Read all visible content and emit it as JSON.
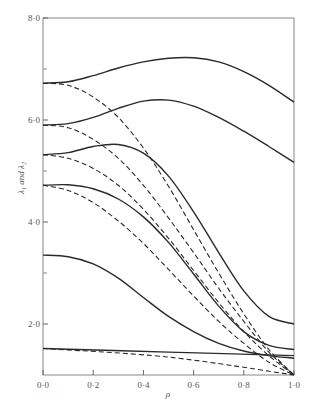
{
  "chart_data": {
    "type": "line",
    "title": "",
    "xlabel": "ρ",
    "ylabel": "λ₁ and λ₂",
    "xlim": [
      0.0,
      1.0
    ],
    "ylim": [
      1.0,
      8.0
    ],
    "grid": false,
    "legend": null,
    "x_ticks": [
      "0·0",
      "0·2",
      "0·4",
      "0·6",
      "0·8",
      "1·0"
    ],
    "x_tick_values": [
      0.0,
      0.2,
      0.4,
      0.6,
      0.8,
      1.0
    ],
    "y_ticks": [
      "2·0",
      "4·0",
      "6·0",
      "8·0"
    ],
    "y_tick_values": [
      2.0,
      4.0,
      6.0,
      8.0
    ],
    "y_minor_ticks": [
      3.0,
      5.0,
      7.0
    ],
    "series": [
      {
        "name": "solid-1",
        "style": "solid",
        "x": [
          0.0,
          0.1,
          0.2,
          0.3,
          0.4,
          0.5,
          0.6,
          0.7,
          0.8,
          0.9,
          1.0
        ],
        "values": [
          6.72,
          6.75,
          6.87,
          7.02,
          7.14,
          7.21,
          7.22,
          7.14,
          6.95,
          6.68,
          6.35
        ]
      },
      {
        "name": "dashed-1",
        "style": "dashed",
        "x": [
          0.0,
          0.1,
          0.2,
          0.3,
          0.4,
          0.5,
          0.6,
          0.7,
          0.8,
          0.9,
          1.0
        ],
        "values": [
          6.72,
          6.68,
          6.45,
          6.05,
          5.45,
          4.7,
          3.85,
          3.0,
          2.2,
          1.5,
          1.0
        ]
      },
      {
        "name": "solid-2",
        "style": "solid",
        "x": [
          0.0,
          0.1,
          0.2,
          0.3,
          0.4,
          0.5,
          0.6,
          0.7,
          0.8,
          0.9,
          1.0
        ],
        "values": [
          5.9,
          5.93,
          6.05,
          6.23,
          6.37,
          6.39,
          6.27,
          6.05,
          5.78,
          5.48,
          5.17
        ]
      },
      {
        "name": "dashed-2",
        "style": "dashed",
        "x": [
          0.0,
          0.1,
          0.2,
          0.3,
          0.4,
          0.5,
          0.6,
          0.7,
          0.8,
          0.9,
          1.0
        ],
        "values": [
          5.9,
          5.85,
          5.62,
          5.25,
          4.72,
          4.08,
          3.4,
          2.7,
          2.05,
          1.45,
          1.0
        ]
      },
      {
        "name": "solid-3",
        "style": "solid",
        "x": [
          0.0,
          0.1,
          0.2,
          0.3,
          0.4,
          0.5,
          0.6,
          0.7,
          0.8,
          0.9,
          1.0
        ],
        "values": [
          5.32,
          5.36,
          5.48,
          5.52,
          5.35,
          4.9,
          4.2,
          3.4,
          2.65,
          2.15,
          2.0
        ]
      },
      {
        "name": "dashed-3",
        "style": "dashed",
        "x": [
          0.0,
          0.1,
          0.2,
          0.3,
          0.4,
          0.5,
          0.6,
          0.7,
          0.8,
          0.9,
          1.0
        ],
        "values": [
          5.32,
          5.25,
          5.05,
          4.72,
          4.25,
          3.68,
          3.05,
          2.42,
          1.85,
          1.38,
          1.0
        ]
      },
      {
        "name": "solid-4",
        "style": "solid",
        "x": [
          0.0,
          0.1,
          0.2,
          0.3,
          0.4,
          0.5,
          0.6,
          0.7,
          0.8,
          0.9,
          1.0
        ],
        "values": [
          4.72,
          4.73,
          4.65,
          4.45,
          4.1,
          3.6,
          2.98,
          2.35,
          1.85,
          1.58,
          1.5
        ]
      },
      {
        "name": "dashed-4",
        "style": "dashed",
        "x": [
          0.0,
          0.1,
          0.2,
          0.3,
          0.4,
          0.5,
          0.6,
          0.7,
          0.8,
          0.9,
          1.0
        ],
        "values": [
          4.72,
          4.62,
          4.38,
          4.02,
          3.58,
          3.07,
          2.55,
          2.05,
          1.62,
          1.25,
          1.0
        ]
      },
      {
        "name": "solid-5",
        "style": "solid",
        "x": [
          0.0,
          0.1,
          0.2,
          0.3,
          0.4,
          0.5,
          0.6,
          0.7,
          0.8,
          0.9,
          1.0
        ],
        "values": [
          3.35,
          3.32,
          3.18,
          2.9,
          2.52,
          2.15,
          1.85,
          1.62,
          1.47,
          1.38,
          1.33
        ]
      },
      {
        "name": "dashed-5",
        "style": "dashed",
        "x": [
          0.0,
          0.5,
          1.0
        ],
        "values": [
          1.52,
          1.35,
          1.0
        ]
      },
      {
        "name": "solid-6",
        "style": "solid",
        "x": [
          0.0,
          0.5,
          1.0
        ],
        "values": [
          1.52,
          1.45,
          1.38
        ]
      }
    ]
  }
}
